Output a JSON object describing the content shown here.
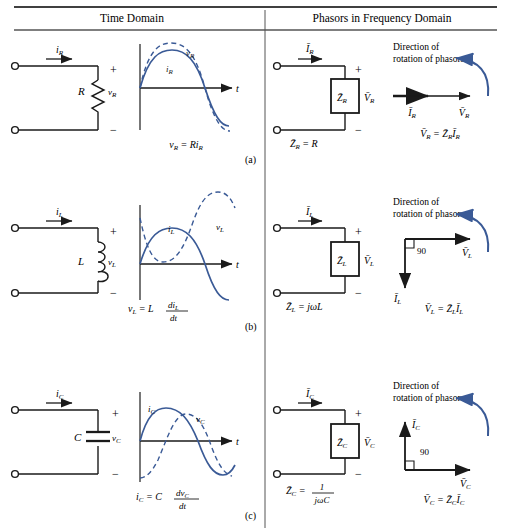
{
  "table": {
    "headers": [
      {
        "id": "time-domain",
        "label": "Time Domain"
      },
      {
        "id": "phasor-domain",
        "label": "Phasors in Frequency Domain"
      }
    ],
    "row_labels": [
      "(a)",
      "(b)",
      "(c)"
    ]
  },
  "common": {
    "rotation_line1": "Direction of",
    "rotation_line2": "rotation of phasors",
    "plus": "+",
    "minus": "−",
    "time_axis": "t",
    "angle_90": "90"
  },
  "rows": [
    {
      "id": "resistor",
      "circuit": {
        "current_label": "i",
        "current_sub": "R",
        "element_label": "R",
        "voltage_label": "v",
        "voltage_sub": "R"
      },
      "waveform": {
        "solid_label": "i",
        "solid_sub": "R",
        "dashed_label": "v",
        "dashed_sub": "R",
        "phase_shift_deg": 0,
        "equation_lhs": "v",
        "equation_lhs_sub": "R",
        "equation_rhs": "Ri",
        "equation_rhs_sub": "R"
      },
      "phasor_circuit": {
        "current_label": "I",
        "current_sub": "R",
        "impedance_label": "Z",
        "impedance_sub": "R",
        "voltage_label": "V",
        "voltage_sub": "R",
        "impedance_eq_lhs": "Z",
        "impedance_eq_sub": "R",
        "impedance_eq_rhs": "R"
      },
      "phasor_diagram": {
        "current_label": "I",
        "current_sub": "R",
        "voltage_label": "V",
        "voltage_sub": "R",
        "current_angle_deg": 0,
        "voltage_angle_deg": 0,
        "show_right_angle": false,
        "relation": "V̄ᵣ = Z̄ᵣ Īᵣ"
      }
    },
    {
      "id": "inductor",
      "circuit": {
        "current_label": "i",
        "current_sub": "L",
        "element_label": "L",
        "voltage_label": "v",
        "voltage_sub": "L"
      },
      "waveform": {
        "solid_label": "i",
        "solid_sub": "L",
        "dashed_label": "v",
        "dashed_sub": "L",
        "phase_shift_deg": 90,
        "equation_lhs": "v",
        "equation_lhs_sub": "L",
        "equation_rhs_coef": "L",
        "equation_num": "di",
        "equation_num_sub": "L",
        "equation_den": "dt"
      },
      "phasor_circuit": {
        "current_label": "I",
        "current_sub": "L",
        "impedance_label": "Z",
        "impedance_sub": "L",
        "voltage_label": "V",
        "voltage_sub": "L",
        "impedance_eq_lhs": "Z",
        "impedance_eq_sub": "L",
        "impedance_eq_rhs": "jωL"
      },
      "phasor_diagram": {
        "current_label": "I",
        "current_sub": "L",
        "voltage_label": "V",
        "voltage_sub": "L",
        "current_angle_deg": -90,
        "voltage_angle_deg": 0,
        "show_right_angle": true,
        "relation": "V̄ʟ = Z̄ʟ Īʟ"
      }
    },
    {
      "id": "capacitor",
      "circuit": {
        "current_label": "i",
        "current_sub": "C",
        "element_label": "C",
        "voltage_label": "v",
        "voltage_sub": "C"
      },
      "waveform": {
        "solid_label": "i",
        "solid_sub": "C",
        "dashed_label": "v",
        "dashed_sub": "C",
        "phase_shift_deg": -90,
        "equation_lhs": "i",
        "equation_lhs_sub": "C",
        "equation_rhs_coef": "C",
        "equation_num": "dv",
        "equation_num_sub": "C",
        "equation_den": "dt"
      },
      "phasor_circuit": {
        "current_label": "I",
        "current_sub": "C",
        "impedance_label": "Z",
        "impedance_sub": "C",
        "voltage_label": "V",
        "voltage_sub": "C",
        "impedance_eq_lhs": "Z",
        "impedance_eq_sub": "C",
        "impedance_eq_num": "1",
        "impedance_eq_den": "jωC"
      },
      "phasor_diagram": {
        "current_label": "I",
        "current_sub": "C",
        "voltage_label": "V",
        "voltage_sub": "C",
        "current_angle_deg": 90,
        "voltage_angle_deg": 0,
        "show_right_angle": true,
        "relation": "V̄_C = Z̄_C Ī_C"
      }
    }
  ],
  "colors": {
    "wave": "#3a5a96",
    "line": "#1a1a1a",
    "rule": "#000000"
  }
}
